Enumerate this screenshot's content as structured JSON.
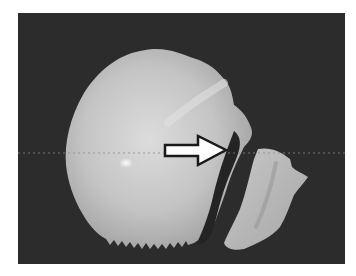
{
  "figure": {
    "background_color": "#2c2c2c",
    "bone_color": "#c9c9c9",
    "bone_highlight_color": "#e6e6e6",
    "fragment_color": "#b8b8b8",
    "arrow": {
      "icon": "right-arrow-icon",
      "fill": "#ffffff",
      "stroke": "#1a1a1a",
      "direction": "right"
    },
    "reference_line": {
      "style": "dotted",
      "color": "#8a8a8a"
    }
  }
}
